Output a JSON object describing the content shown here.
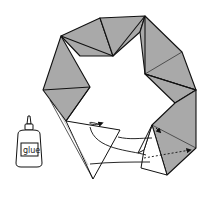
{
  "diagram": {
    "type": "origami-assembly-instruction",
    "colors": {
      "unit_fill": "#a9a9a9",
      "outline": "#111111",
      "paper_white": "#ffffff",
      "background": "#ffffff"
    },
    "glue_bottle": {
      "label": "glue"
    },
    "arrows": [
      {
        "name": "tuck-arrow-1",
        "style": "solid"
      },
      {
        "name": "tuck-arrow-2",
        "style": "solid"
      },
      {
        "name": "tuck-arrow-3",
        "style": "solid"
      },
      {
        "name": "rotate-arrow",
        "style": "solid"
      },
      {
        "name": "insert-arrow",
        "style": "dotted"
      }
    ]
  }
}
